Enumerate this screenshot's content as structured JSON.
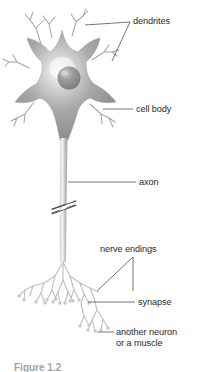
{
  "figure": {
    "caption": "Figure 1.2",
    "background_color": "#ffffff",
    "label_color": "#2b2b2b",
    "leader_line_color": "#4a4a4a",
    "cell_fill_dark": "#8e8e8e",
    "cell_fill_light": "#f2f2f2",
    "nucleus_color": "#8a8a8a",
    "branch_color": "#b9b9b9"
  },
  "labels": {
    "dendrites": "dendrites",
    "cell_body": "cell body",
    "axon": "axon",
    "nerve_endings": "nerve endings",
    "synapse": "synapse",
    "another_neuron_line1": "another neuron",
    "another_neuron_line2": "or a muscle"
  },
  "parts": [
    {
      "name": "dendrites",
      "label": "dendrites"
    },
    {
      "name": "cell-body",
      "label": "cell body"
    },
    {
      "name": "nucleus",
      "label": "nucleus"
    },
    {
      "name": "axon",
      "label": "axon"
    },
    {
      "name": "axon-break",
      "label": "axon break marks"
    },
    {
      "name": "nerve-endings",
      "label": "nerve endings"
    },
    {
      "name": "synapse",
      "label": "synapse"
    },
    {
      "name": "target-cell",
      "label": "another neuron or a muscle"
    }
  ]
}
